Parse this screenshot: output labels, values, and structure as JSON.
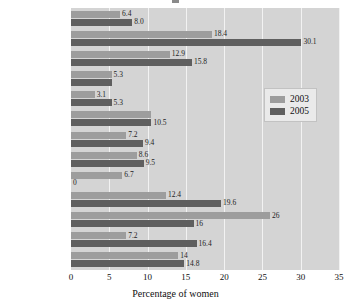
{
  "chart_data": {
    "type": "bar",
    "orientation": "horizontal",
    "title": "",
    "xlabel": "Percentage of women",
    "ylabel": "",
    "xlim": [
      0,
      35
    ],
    "xticks": [
      0,
      5,
      10,
      15,
      20,
      25,
      30,
      35
    ],
    "grid": true,
    "legend_position": "right",
    "categories": [
      "Russia",
      "Belarus",
      "Moldova",
      "Ukraine",
      "Armenia",
      "Azerbaijan",
      "Georgia",
      "Kazakhstan",
      "Kyrgyzstan",
      "Tajikistan",
      "Turkmenistan",
      "Uzbekistan",
      "United States"
    ],
    "series": [
      {
        "name": "2003",
        "color": "#9d9d9d",
        "values": [
          6.4,
          18.4,
          12.9,
          5.3,
          3.1,
          10.5,
          7.2,
          8.6,
          6.7,
          12.4,
          26,
          7.2,
          14
        ],
        "labels": [
          "6.4",
          "18.4",
          "12.9",
          "5.3",
          "3.1",
          "",
          "7.2",
          "8.6",
          "6.7",
          "12.4",
          "26",
          "7.2",
          "14"
        ]
      },
      {
        "name": "2005",
        "color": "#5f5f5f",
        "values": [
          8.0,
          30.1,
          15.8,
          5.3,
          5.3,
          10.5,
          9.4,
          9.5,
          0,
          19.6,
          16,
          16.4,
          14.8
        ],
        "labels": [
          "8.0",
          "30.1",
          "15.8",
          "",
          "5.3",
          "10.5",
          "9.4",
          "9.5",
          "0",
          "19.6",
          "16",
          "16.4",
          "14.8"
        ]
      }
    ]
  },
  "legend": {
    "items": [
      {
        "label": "2003",
        "color": "#9d9d9d"
      },
      {
        "label": "2005",
        "color": "#5f5f5f"
      }
    ]
  },
  "axis": {
    "x_title": "Percentage of women",
    "x_tick_labels": [
      "0",
      "5",
      "10",
      "15",
      "20",
      "25",
      "30",
      "35"
    ]
  },
  "colors": {
    "plot_background": "#d4d4d4",
    "gridline": "#f2f2f2",
    "series_2003": "#9d9d9d",
    "series_2005": "#5f5f5f",
    "text": "#111111"
  }
}
